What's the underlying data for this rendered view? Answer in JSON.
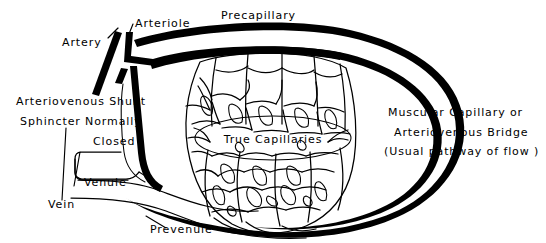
{
  "figure": {
    "background_color": "#ffffff",
    "ink_color": "#000000",
    "width": 546,
    "height": 243
  },
  "labels": {
    "artery": "Artery",
    "arteriole": "Arteriole",
    "precapillary": "Precapillary",
    "shunt_line1": "Arteriovenous Shunt",
    "shunt_line2": "Sphincter Normally",
    "shunt_line3": "Closed",
    "true_capillaries": "True Capillaries",
    "bridge_line1": "Muscular Capillary or",
    "bridge_line2": "Arteriovenous Bridge",
    "bridge_line3": "(Usual pathway of flow )",
    "venule": "Venule",
    "vein": "Vein",
    "prevenule": "Prevenule"
  }
}
